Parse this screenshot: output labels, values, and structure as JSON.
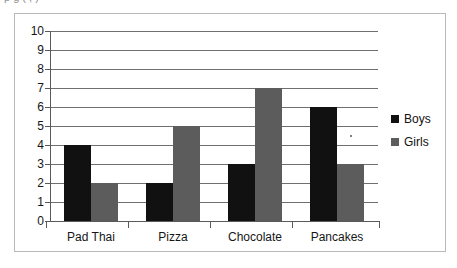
{
  "page": {
    "truncated_top_text": "p                   g            (  ,  )"
  },
  "chart_data": {
    "type": "bar",
    "title": "",
    "xlabel": "",
    "ylabel": "",
    "categories": [
      "Pad Thai",
      "Pizza",
      "Chocolate",
      "Pancakes"
    ],
    "series": [
      {
        "name": "Boys",
        "color": "#111111",
        "values": [
          4,
          2,
          3,
          6
        ]
      },
      {
        "name": "Girls",
        "color": "#5c5c5c",
        "values": [
          2,
          5,
          7,
          3
        ]
      }
    ],
    "ylim": [
      0,
      10
    ],
    "y_ticks": [
      10,
      9,
      8,
      7,
      6,
      5,
      4,
      3,
      2,
      1,
      0
    ],
    "y_tick_labels": [
      "10",
      "9",
      "8",
      "7",
      "6",
      "5",
      "4",
      "3",
      "2",
      "1",
      "0"
    ],
    "grid": true,
    "grid_axis": "y",
    "legend": {
      "position": "right",
      "entries": [
        {
          "label": "Boys",
          "swatch_color": "#111111"
        },
        {
          "label": "Girls",
          "swatch_color": "#5c5c5c"
        }
      ]
    }
  }
}
